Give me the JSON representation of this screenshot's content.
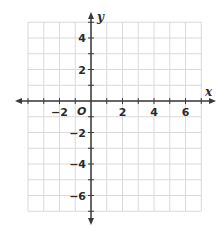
{
  "graph": {
    "x_axis_label": "x",
    "y_axis_label": "y",
    "origin_label": "O",
    "x_range": [
      -4,
      7
    ],
    "y_range": [
      -7,
      5
    ],
    "x_ticks": [
      {
        "value": -2,
        "label": "−2"
      },
      {
        "value": 2,
        "label": "2"
      },
      {
        "value": 4,
        "label": "4"
      },
      {
        "value": 6,
        "label": "6"
      }
    ],
    "y_ticks": [
      {
        "value": 4,
        "label": "4"
      },
      {
        "value": 2,
        "label": "2"
      },
      {
        "value": -2,
        "label": "−2"
      },
      {
        "value": -4,
        "label": "−4"
      },
      {
        "value": -6,
        "label": "−6"
      }
    ],
    "colors": {
      "grid": "#d9d9d9",
      "axis": "#3a3a3a",
      "text": "#2a2a2a"
    }
  },
  "chart_data": {
    "type": "scatter",
    "title": "",
    "xlabel": "x",
    "ylabel": "y",
    "xlim": [
      -4,
      7
    ],
    "ylim": [
      -7,
      5
    ],
    "x_tick_labels": [
      "−2",
      "2",
      "4",
      "6"
    ],
    "y_tick_labels": [
      "4",
      "2",
      "−2",
      "−4",
      "−6"
    ],
    "grid": true,
    "series": [],
    "annotations": [
      "O (origin)"
    ]
  }
}
